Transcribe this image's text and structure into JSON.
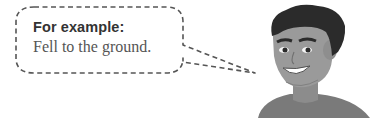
{
  "speech_bubble": {
    "heading": "For example:",
    "text": "Fell to the ground."
  },
  "illustration": {
    "subject": "smiling-man-avatar",
    "palette": {
      "outline": "#555555",
      "hair": "#2b2b2b",
      "skin": "#9a9a9a",
      "skin_shadow": "#808080",
      "shirt": "#7a7a7a",
      "teeth": "#ffffff"
    }
  }
}
